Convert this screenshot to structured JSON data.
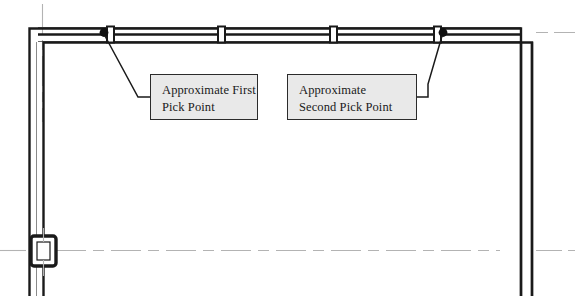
{
  "drawing": {
    "type": "architectural-floor-plan",
    "title": "",
    "background_color": "#ffffff",
    "line_color": "#1a1a1a",
    "centerline_color": "#b0b0b0",
    "wall": {
      "outer_color": "#1a1a1a",
      "thin_line_color": "#5a5a5a",
      "thickness_px": 13
    },
    "annotation_box": {
      "fill_color": "#e9e9e9",
      "border_color": "#2b2b2b",
      "text_color": "#1a1a1a"
    }
  },
  "callouts": [
    {
      "id": "first-pick-point",
      "line1": "Approximate First",
      "line2": "Pick Point",
      "x": 150,
      "y": 74,
      "width": 108,
      "height": 46
    },
    {
      "id": "second-pick-point",
      "line1": "Approximate",
      "line2": "Second Pick Point",
      "x": 287,
      "y": 74,
      "width": 130,
      "height": 46
    }
  ],
  "pick_points": [
    {
      "id": "first-pick-point-marker",
      "x": 104,
      "y": 32,
      "radius": 4.2
    },
    {
      "id": "second-pick-point-marker",
      "x": 443,
      "y": 32,
      "radius": 4.2
    }
  ],
  "leaders": [
    {
      "id": "leader-first",
      "from_x": 106,
      "from_y": 36,
      "to_x": 150,
      "to_y": 98
    },
    {
      "id": "leader-second",
      "from_x": 441,
      "from_y": 36,
      "to_x": 417,
      "to_y": 98
    }
  ],
  "mullions": [
    {
      "id": "mullion-left",
      "x": 218,
      "y": 27,
      "width": 7,
      "height": 15
    },
    {
      "id": "mullion-right",
      "x": 330,
      "y": 27,
      "width": 7,
      "height": 15
    }
  ],
  "column": {
    "id": "column-symbol",
    "x": 31,
    "y": 236,
    "width": 25,
    "height": 30
  }
}
